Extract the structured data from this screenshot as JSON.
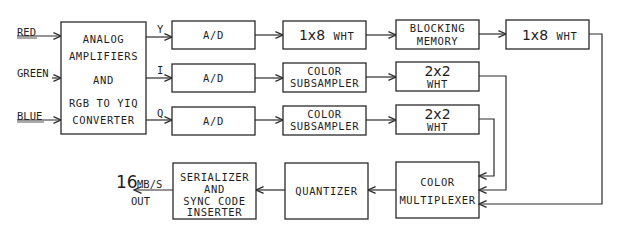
{
  "inputs": {
    "red": "RED",
    "green": "GREEN",
    "blue": "BLUE"
  },
  "signals": {
    "y": "Y",
    "i": "I",
    "q": "Q"
  },
  "blocks": {
    "converter": {
      "line1": "ANALOG",
      "line2": "AMPLIFIERS",
      "line3": "AND",
      "line4": "RGB TO YIQ",
      "line5": "CONVERTER"
    },
    "ad_y": {
      "label": "A/D"
    },
    "ad_i": {
      "label": "A/D"
    },
    "ad_q": {
      "label": "A/D"
    },
    "wht_1x8_a": {
      "num": "1x8",
      "unit": "WHT"
    },
    "subsampler_i": {
      "line1": "COLOR",
      "line2": "SUBSAMPLER"
    },
    "subsampler_q": {
      "line1": "COLOR",
      "line2": "SUBSAMPLER"
    },
    "blocking_memory": {
      "line1": "BLOCKING",
      "line2": "MEMORY"
    },
    "wht_1x8_b": {
      "num": "1x8",
      "unit": "WHT"
    },
    "wht_2x2_i": {
      "num": "2x2",
      "unit": "WHT"
    },
    "wht_2x2_q": {
      "num": "2x2",
      "unit": "WHT"
    },
    "color_multiplexer": {
      "line1": "COLOR",
      "line2": "MULTIPLEXER"
    },
    "quantizer": {
      "label": "QUANTIZER"
    },
    "serializer": {
      "line1": "SERIALIZER",
      "line2": "AND",
      "line3": "SYNC CODE",
      "line4": "INSERTER"
    }
  },
  "output": {
    "rate_value": "16",
    "rate_unit": "MB/S",
    "label": "OUT"
  },
  "colors": {
    "ink": "#2a2a2a",
    "background": "#ffffff"
  }
}
